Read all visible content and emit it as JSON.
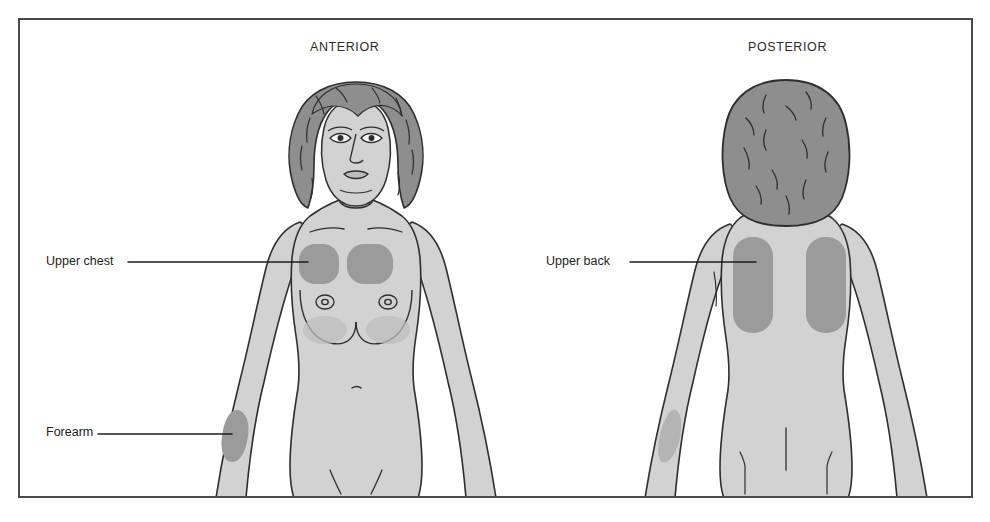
{
  "diagram": {
    "type": "anatomical-body-map",
    "border_color": "#4a4a4a",
    "background_color": "#ffffff"
  },
  "panels": [
    {
      "id": "anterior",
      "title": "ANTERIOR",
      "view": "front",
      "shaded_regions": [
        "upper chest (left)",
        "upper chest (right)",
        "forearm (right arm of viewer-left)"
      ]
    },
    {
      "id": "posterior",
      "title": "POSTERIOR",
      "view": "back",
      "shaded_regions": [
        "upper back (left)",
        "upper back (right)",
        "forearm (faint)"
      ]
    }
  ],
  "callouts": [
    {
      "id": "upper-chest",
      "label": "Upper chest",
      "panel": "anterior"
    },
    {
      "id": "forearm",
      "label": "Forearm",
      "panel": "anterior"
    },
    {
      "id": "upper-back",
      "label": "Upper back",
      "panel": "posterior"
    }
  ],
  "colors": {
    "skin": "#d2d2d2",
    "skin_outline": "#2e2e2e",
    "hair": "#8e8e8e",
    "shaded_region": "#9b9b9b",
    "shaded_region_soft": "#b4b4b4",
    "leader_line": "#1d1d1d",
    "text": "#1d1d1d",
    "frame": "#4a4a4a"
  }
}
